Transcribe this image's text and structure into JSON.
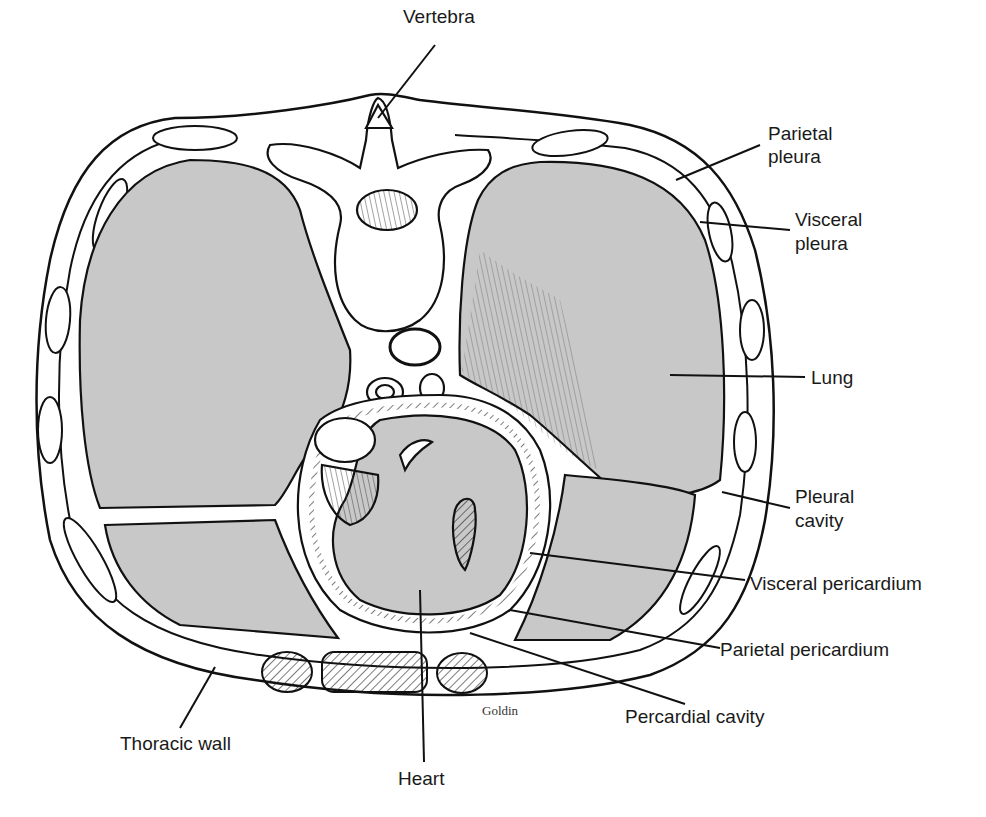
{
  "figure": {
    "signature": "Goldin",
    "colors": {
      "outline": "#111111",
      "lung_fill": "#c8c8c8",
      "tissue_fill": "#ffffff",
      "background": "#ffffff"
    }
  },
  "labels": {
    "vertebra": "Vertebra",
    "parietal_pleura_1": "Parietal",
    "parietal_pleura_2": "pleura",
    "visceral_pleura_1": "Visceral",
    "visceral_pleura_2": "pleura",
    "lung": "Lung",
    "pleural_cavity_1": "Pleural",
    "pleural_cavity_2": "cavity",
    "visceral_pericardium": "Visceral pericardium",
    "parietal_pericardium": "Parietal pericardium",
    "pericardial_cavity": "Percardial cavity",
    "thoracic_wall": "Thoracic wall",
    "heart": "Heart"
  }
}
